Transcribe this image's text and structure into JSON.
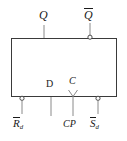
{
  "figure": {
    "kind": "logic-symbol",
    "device": "D flip-flop",
    "background_color": "#ffffff",
    "line_color": "#3a3a3a",
    "text_color": "#1a1a1a"
  },
  "body": {
    "shape": "rectangle",
    "x": 11,
    "y": 38,
    "width": 106,
    "height": 59
  },
  "outputs": [
    {
      "id": "q",
      "label": "Q",
      "overline": false,
      "subscript": "",
      "inverted": false,
      "bubble": false,
      "side": "top",
      "x": 44
    },
    {
      "id": "qbar",
      "label": "Q",
      "overline": true,
      "subscript": "",
      "inverted": true,
      "bubble": true,
      "side": "top",
      "x": 90
    }
  ],
  "inputs": [
    {
      "id": "rd",
      "label": "R",
      "overline": true,
      "subscript": "d",
      "inverted": true,
      "bubble": true,
      "dynamic": false,
      "side": "bottom",
      "x": 22
    },
    {
      "id": "d",
      "label": "D",
      "overline": false,
      "subscript": "",
      "inverted": false,
      "bubble": false,
      "dynamic": false,
      "side": "bottom",
      "x": 51
    },
    {
      "id": "cp",
      "label": "CP",
      "internal_label": "C",
      "overline": false,
      "subscript": "",
      "inverted": false,
      "bubble": false,
      "dynamic": true,
      "side": "bottom",
      "x": 73
    },
    {
      "id": "sd",
      "label": "S",
      "overline": true,
      "subscript": "d",
      "inverted": true,
      "bubble": true,
      "dynamic": false,
      "side": "bottom",
      "x": 98
    }
  ],
  "labels": {
    "q": "Q",
    "qbar": "Q",
    "d": "D",
    "c": "C",
    "rd": "R",
    "rd_sub": "d",
    "cp": "CP",
    "sd": "S",
    "sd_sub": "d"
  }
}
